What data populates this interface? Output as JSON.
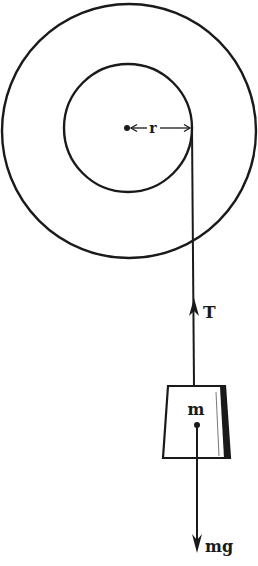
{
  "diagram": {
    "type": "free-body diagram of mass hanging from rope wound on pulley",
    "colors": {
      "ink": "#1a1a1a",
      "background": "#ffffff"
    },
    "pulley": {
      "outer_circle": {
        "cx": 129,
        "cy": 131,
        "r": 128
      },
      "inner_circle": {
        "cx": 128,
        "cy": 128,
        "r": 64
      },
      "center_dot": {
        "x": 127,
        "y": 128
      },
      "radius_label": "r"
    },
    "rope": {
      "x_top": 192,
      "y_top": 128,
      "x_bottom": 194,
      "y_bottom": 386
    },
    "tension": {
      "label": "T",
      "arrow_tip": {
        "x": 194,
        "y": 300
      }
    },
    "block": {
      "label": "m",
      "top_left": [
        168,
        386
      ],
      "top_right": [
        225,
        386
      ],
      "bottom_right": [
        230,
        458
      ],
      "bottom_left": [
        163,
        458
      ],
      "center_of_mass": {
        "x": 197,
        "y": 425
      }
    },
    "weight": {
      "label": "mg",
      "arrow_tip": {
        "x": 197,
        "y": 552
      }
    }
  }
}
